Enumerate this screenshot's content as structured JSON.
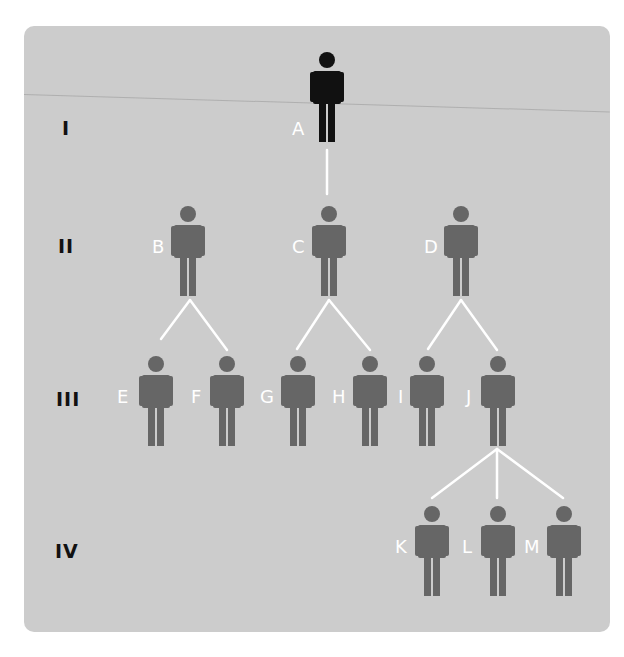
{
  "diagram": {
    "type": "pedigree / family tree",
    "colors": {
      "background": "#cccccc",
      "founder": "#111111",
      "descendant": "#666666",
      "connector": "#ffffff",
      "name_label": "#ffffff"
    },
    "generations": [
      {
        "id": "gen-1",
        "label": "I"
      },
      {
        "id": "gen-2",
        "label": "II"
      },
      {
        "id": "gen-3",
        "label": "III"
      },
      {
        "id": "gen-4",
        "label": "IV"
      }
    ],
    "people": {
      "A": {
        "label": "A",
        "generation": "I",
        "highlighted": true
      },
      "B": {
        "label": "B",
        "generation": "II"
      },
      "C": {
        "label": "C",
        "generation": "II"
      },
      "D": {
        "label": "D",
        "generation": "II"
      },
      "E": {
        "label": "E",
        "generation": "III"
      },
      "F": {
        "label": "F",
        "generation": "III"
      },
      "G": {
        "label": "G",
        "generation": "III"
      },
      "H": {
        "label": "H",
        "generation": "III"
      },
      "I": {
        "label": "I",
        "generation": "III"
      },
      "J": {
        "label": "J",
        "generation": "III"
      },
      "K": {
        "label": "K",
        "generation": "IV"
      },
      "L": {
        "label": "L",
        "generation": "IV"
      },
      "M": {
        "label": "M",
        "generation": "IV"
      }
    },
    "edges": [
      [
        "A",
        "C"
      ],
      [
        "B",
        "E"
      ],
      [
        "B",
        "F"
      ],
      [
        "C",
        "G"
      ],
      [
        "C",
        "H"
      ],
      [
        "D",
        "I"
      ],
      [
        "D",
        "J"
      ],
      [
        "J",
        "K"
      ],
      [
        "J",
        "L"
      ],
      [
        "J",
        "M"
      ]
    ]
  }
}
